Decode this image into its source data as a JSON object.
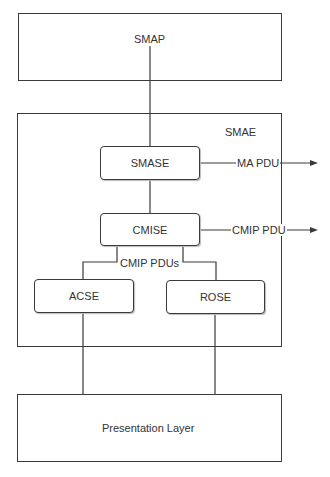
{
  "diagram": {
    "type": "layered-architecture",
    "colors": {
      "line": "#3a3a3a",
      "text": "#333333",
      "background": "#ffffff"
    },
    "nodes": {
      "smap": {
        "label": "SMAP"
      },
      "smae": {
        "label": "SMAE"
      },
      "smase": {
        "label": "SMASE"
      },
      "cmise": {
        "label": "CMISE"
      },
      "acse": {
        "label": "ACSE"
      },
      "rose": {
        "label": "ROSE"
      },
      "presentation": {
        "label": "Presentation Layer"
      }
    },
    "edges": {
      "ma_pdu": {
        "label": "MA PDU",
        "from": "SMASE",
        "direction": "out"
      },
      "cmip_pdu": {
        "label": "CMIP PDU",
        "from": "CMISE",
        "direction": "out"
      },
      "cmip_pdus": {
        "label": "CMIP PDUs",
        "from": "CMISE",
        "to": [
          "ACSE",
          "ROSE"
        ]
      }
    }
  }
}
